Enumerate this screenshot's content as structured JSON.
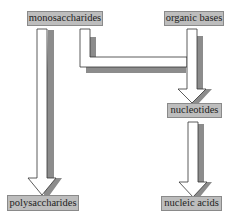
{
  "diagram": {
    "type": "flow",
    "nodes": [
      {
        "id": "monosaccharides",
        "label": "monosaccharides"
      },
      {
        "id": "organic_bases",
        "label": "organic bases"
      },
      {
        "id": "nucleotides",
        "label": "nucleotides"
      },
      {
        "id": "polysaccharides",
        "label": "polysaccharides"
      },
      {
        "id": "nucleic_acids",
        "label": "nucleic acids"
      }
    ],
    "edges": [
      {
        "from": "monosaccharides",
        "to": "polysaccharides"
      },
      {
        "from": "monosaccharides",
        "to": "nucleotides"
      },
      {
        "from": "organic_bases",
        "to": "nucleotides"
      },
      {
        "from": "nucleotides",
        "to": "nucleic_acids"
      }
    ]
  },
  "colors": {
    "box_fill": "#bdbdbd",
    "box_border": "#8a8a8a",
    "arrow_fill": "#ffffff",
    "arrow_stroke": "#333333",
    "arrow_shadow": "#8c8c8c"
  }
}
